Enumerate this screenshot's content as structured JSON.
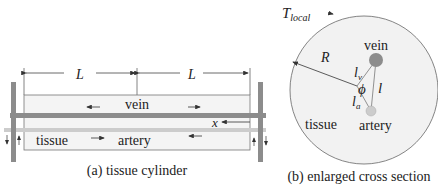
{
  "figure_a": {
    "caption": "(a) tissue cylinder",
    "dimension_left": "L",
    "dimension_right": "L",
    "vein_label": "vein",
    "artery_label": "artery",
    "tissue_label": "tissue",
    "x_label": "x"
  },
  "figure_b": {
    "caption": "(b) enlarged cross section",
    "t_local_main": "T",
    "t_local_sub": "local",
    "radius_label": "R",
    "vein_label": "vein",
    "artery_label": "artery",
    "tissue_label": "tissue",
    "lv_main": "l",
    "lv_sub": "v",
    "la_main": "l",
    "la_sub": "a",
    "phi_label": "ϕ",
    "l_label": "l"
  },
  "colors": {
    "vein": "#8c8c8c",
    "artery": "#c8c8c8",
    "tissue_fill": "#f2f2f2",
    "outline": "#555555"
  }
}
